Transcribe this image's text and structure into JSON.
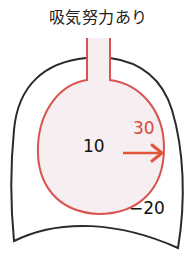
{
  "title": "吸気努力あり",
  "labels": {
    "alveolar_pressure": "10",
    "transpulmonary_pressure": "30",
    "pleural_pressure": "−20"
  },
  "colors": {
    "outline": "#2a2a2a",
    "lung_stroke": "#d9534f",
    "lung_fill": "#f6eef1",
    "arrow": "#e2553a",
    "label_red": "#d9473a",
    "text": "#111111"
  },
  "icons": {
    "arrow": "arrow-right-icon"
  }
}
